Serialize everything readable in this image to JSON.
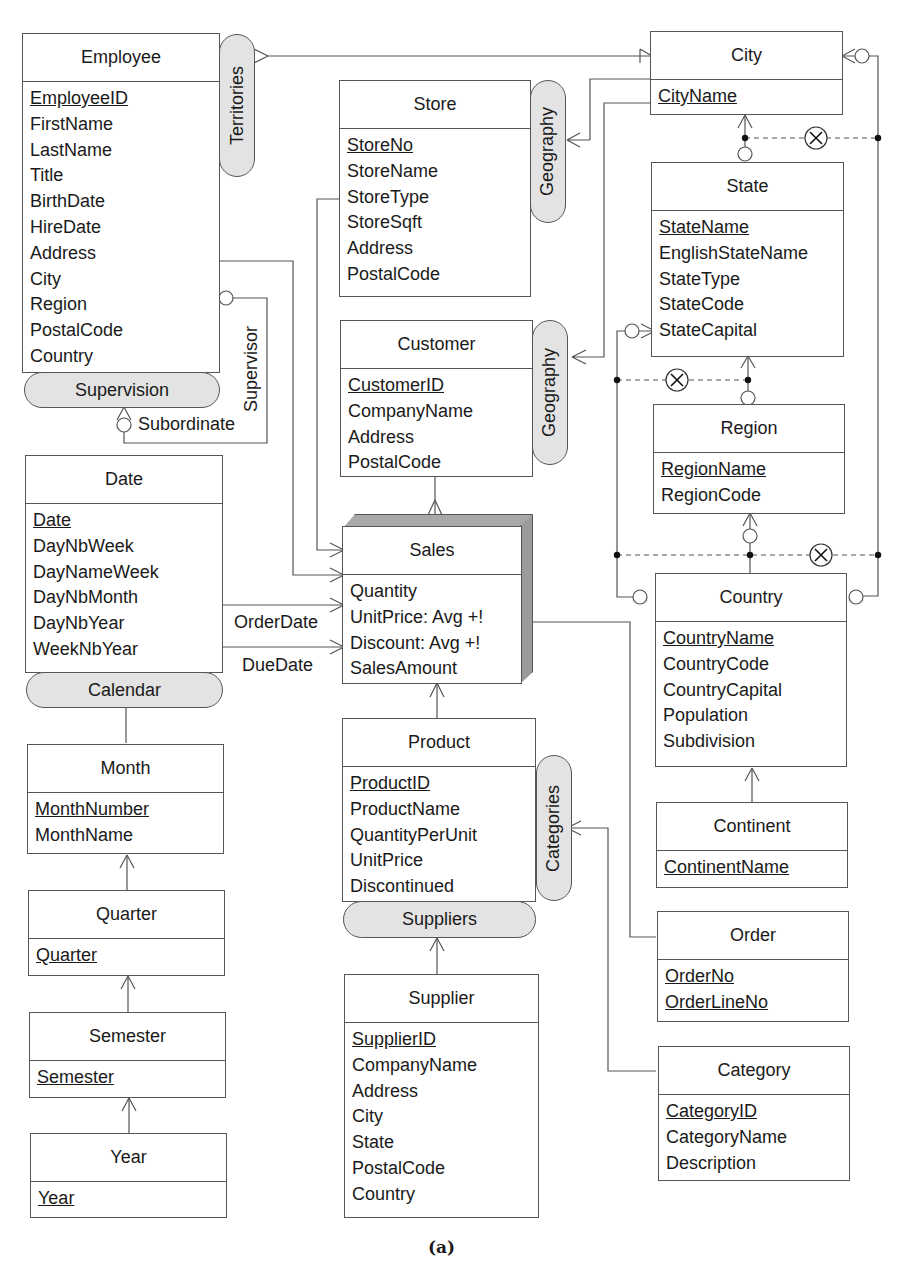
{
  "caption": "(a)",
  "entities": {
    "employee": {
      "name": "Employee",
      "attributes": [
        {
          "label": "EmployeeID",
          "key": true
        },
        {
          "label": "FirstName"
        },
        {
          "label": "LastName"
        },
        {
          "label": "Title"
        },
        {
          "label": "BirthDate"
        },
        {
          "label": "HireDate"
        },
        {
          "label": "Address"
        },
        {
          "label": "City"
        },
        {
          "label": "Region"
        },
        {
          "label": "PostalCode"
        },
        {
          "label": "Country"
        }
      ]
    },
    "store": {
      "name": "Store",
      "attributes": [
        {
          "label": "StoreNo",
          "key": true
        },
        {
          "label": "StoreName"
        },
        {
          "label": "StoreType"
        },
        {
          "label": "StoreSqft"
        },
        {
          "label": "Address"
        },
        {
          "label": "PostalCode"
        }
      ]
    },
    "customer": {
      "name": "Customer",
      "attributes": [
        {
          "label": "CustomerID",
          "key": true
        },
        {
          "label": "CompanyName"
        },
        {
          "label": "Address"
        },
        {
          "label": "PostalCode"
        }
      ]
    },
    "city": {
      "name": "City",
      "attributes": [
        {
          "label": "CityName",
          "key": true
        }
      ]
    },
    "state": {
      "name": "State",
      "attributes": [
        {
          "label": "StateName",
          "key": true
        },
        {
          "label": "EnglishStateName"
        },
        {
          "label": "StateType"
        },
        {
          "label": "StateCode"
        },
        {
          "label": "StateCapital"
        }
      ]
    },
    "region": {
      "name": "Region",
      "attributes": [
        {
          "label": "RegionName",
          "key": true
        },
        {
          "label": "RegionCode"
        }
      ]
    },
    "country": {
      "name": "Country",
      "attributes": [
        {
          "label": "CountryName",
          "key": true
        },
        {
          "label": "CountryCode"
        },
        {
          "label": "CountryCapital"
        },
        {
          "label": "Population"
        },
        {
          "label": "Subdivision"
        }
      ]
    },
    "continent": {
      "name": "Continent",
      "attributes": [
        {
          "label": "ContinentName",
          "key": true
        }
      ]
    },
    "date": {
      "name": "Date",
      "attributes": [
        {
          "label": "Date",
          "key": true
        },
        {
          "label": "DayNbWeek"
        },
        {
          "label": "DayNameWeek"
        },
        {
          "label": "DayNbMonth"
        },
        {
          "label": "DayNbYear"
        },
        {
          "label": "WeekNbYear"
        }
      ]
    },
    "sales": {
      "name": "Sales",
      "fact": true,
      "attributes": [
        {
          "label": "Quantity"
        },
        {
          "label": "UnitPrice: Avg +!"
        },
        {
          "label": "Discount: Avg +!"
        },
        {
          "label": "SalesAmount"
        }
      ]
    },
    "month": {
      "name": "Month",
      "attributes": [
        {
          "label": "MonthNumber",
          "key": true
        },
        {
          "label": "MonthName"
        }
      ]
    },
    "quarter": {
      "name": "Quarter",
      "attributes": [
        {
          "label": "Quarter",
          "key": true
        }
      ]
    },
    "semester": {
      "name": "Semester",
      "attributes": [
        {
          "label": "Semester",
          "key": true
        }
      ]
    },
    "year": {
      "name": "Year",
      "attributes": [
        {
          "label": "Year",
          "key": true
        }
      ]
    },
    "product": {
      "name": "Product",
      "attributes": [
        {
          "label": "ProductID",
          "key": true
        },
        {
          "label": "ProductName"
        },
        {
          "label": "QuantityPerUnit"
        },
        {
          "label": "UnitPrice"
        },
        {
          "label": "Discontinued"
        }
      ]
    },
    "supplier": {
      "name": "Supplier",
      "attributes": [
        {
          "label": "SupplierID",
          "key": true
        },
        {
          "label": "CompanyName"
        },
        {
          "label": "Address"
        },
        {
          "label": "City"
        },
        {
          "label": "State"
        },
        {
          "label": "PostalCode"
        },
        {
          "label": "Country"
        }
      ]
    },
    "order": {
      "name": "Order",
      "attributes": [
        {
          "label": "OrderNo",
          "key": true
        },
        {
          "label": "OrderLineNo",
          "key": true
        }
      ]
    },
    "category": {
      "name": "Category",
      "attributes": [
        {
          "label": "CategoryID",
          "key": true
        },
        {
          "label": "CategoryName"
        },
        {
          "label": "Description"
        }
      ]
    }
  },
  "hierarchies": {
    "territories": "Territories",
    "supervision": "Supervision",
    "geography_store": "Geography",
    "geography_customer": "Geography",
    "calendar": "Calendar",
    "categories": "Categories",
    "suppliers": "Suppliers"
  },
  "role_labels": {
    "supervisor": "Supervisor",
    "subordinate": "Subordinate",
    "order_date": "OrderDate",
    "due_date": "DueDate"
  },
  "colors": {
    "line": "#555555",
    "pill_fill": "#e3e3e3",
    "fact_shade_top": "#a9a9a9",
    "fact_shade_side": "#9b9b9b"
  }
}
